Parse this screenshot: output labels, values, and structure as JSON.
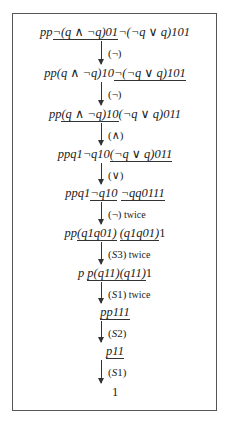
{
  "lines": [
    {
      "segments": [
        {
          "t": "pp",
          "it": true,
          "ul": false
        },
        {
          "t": "¬(q ∧ ¬q)01",
          "it": true,
          "ul": true
        },
        {
          "t": "¬(¬q ∨ q)101",
          "it": true,
          "ul": false
        }
      ]
    },
    {
      "segments": [
        {
          "t": "pp(q ∧ ¬q)10",
          "it": true,
          "ul": false
        },
        {
          "t": "¬(¬q ∨ q)101",
          "it": true,
          "ul": true
        }
      ]
    },
    {
      "segments": [
        {
          "t": "pp",
          "it": true,
          "ul": false
        },
        {
          "t": "(q ∧ ¬q)10",
          "it": true,
          "ul": true
        },
        {
          "t": "(¬q ∨ q)011",
          "it": true,
          "ul": false
        }
      ]
    },
    {
      "segments": [
        {
          "t": "ppq1¬q10",
          "it": true,
          "ul": false
        },
        {
          "t": "(¬q ∨ q)011",
          "it": true,
          "ul": true
        }
      ]
    },
    {
      "segments": [
        {
          "t": "ppq1",
          "it": true,
          "ul": false
        },
        {
          "t": "¬q10",
          "it": true,
          "ul": true
        },
        {
          "t": " ",
          "it": false,
          "ul": false
        },
        {
          "t": "¬qq0111",
          "it": true,
          "ul": true
        }
      ]
    },
    {
      "segments": [
        {
          "t": "pp",
          "it": true,
          "ul": false
        },
        {
          "t": "(q1q01)",
          "it": true,
          "ul": true
        },
        {
          "t": " ",
          "it": false,
          "ul": false
        },
        {
          "t": "(q1q01)",
          "it": true,
          "ul": true
        },
        {
          "t": "1",
          "it": false,
          "ul": false
        }
      ]
    },
    {
      "segments": [
        {
          "t": "p ",
          "it": true,
          "ul": false
        },
        {
          "t": "p(q11)(q11)",
          "it": true,
          "ul": true
        },
        {
          "t": "1",
          "it": false,
          "ul": false
        }
      ]
    },
    {
      "segments": [
        {
          "t": "pp111",
          "it": true,
          "ul": true
        }
      ]
    },
    {
      "segments": [
        {
          "t": "p11",
          "it": true,
          "ul": true
        }
      ]
    },
    {
      "segments": [
        {
          "t": "1",
          "it": false,
          "ul": false
        }
      ]
    }
  ],
  "rules": [
    {
      "label": "(¬)",
      "suffix": ""
    },
    {
      "label": "(¬)",
      "suffix": ""
    },
    {
      "label": "(∧)",
      "suffix": ""
    },
    {
      "label": "(∨)",
      "suffix": ""
    },
    {
      "label": "(¬)",
      "suffix": "twice"
    },
    {
      "label": "(S3)",
      "suffix": "twice"
    },
    {
      "label": "(S1)",
      "suffix": "twice"
    },
    {
      "label": "(S2)",
      "suffix": ""
    },
    {
      "label": "(S1)",
      "suffix": ""
    }
  ]
}
